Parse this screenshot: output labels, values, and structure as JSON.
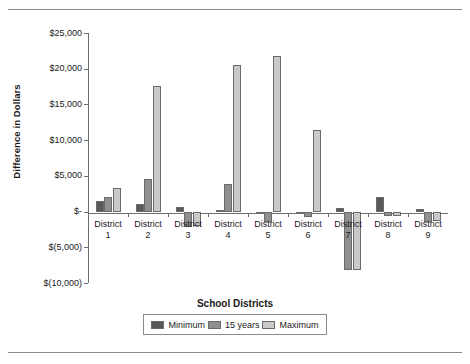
{
  "chart_data": {
    "type": "bar",
    "title": "",
    "xlabel": "School Districts",
    "ylabel": "Difference in Dollars",
    "categories": [
      "District 1",
      "District 2",
      "District 3",
      "District 4",
      "District 5",
      "District 6",
      "District 7",
      "District 8",
      "District 9"
    ],
    "category_lines": [
      [
        "District",
        "1"
      ],
      [
        "District",
        "2"
      ],
      [
        "District",
        "3"
      ],
      [
        "District",
        "4"
      ],
      [
        "District",
        "5"
      ],
      [
        "District",
        "6"
      ],
      [
        "District",
        "7"
      ],
      [
        "District",
        "8"
      ],
      [
        "District",
        "9"
      ]
    ],
    "series": [
      {
        "name": "Minimum",
        "color": "#595959",
        "values": [
          1500,
          1100,
          600,
          250,
          -200,
          -150,
          500,
          2000,
          400
        ]
      },
      {
        "name": "15 years",
        "color": "#8f8f8f",
        "values": [
          2100,
          4600,
          -2100,
          3850,
          -1500,
          -700,
          -8200,
          -600,
          -1400
        ]
      },
      {
        "name": "Maximum",
        "color": "#c9c9c9",
        "values": [
          3300,
          17600,
          -2050,
          20500,
          21800,
          11400,
          -8200,
          -600,
          -1350
        ]
      }
    ],
    "ylim": [
      -10000,
      25000
    ],
    "yticks": [
      25000,
      20000,
      15000,
      10000,
      5000,
      0,
      -5000,
      -10000
    ],
    "ytick_labels": [
      "$25,000",
      "$20,000",
      "$15,000",
      "$10,000",
      "$5,000",
      "$-",
      "$(5,000)",
      "$(10,000)"
    ],
    "grid": false,
    "legend_position": "bottom",
    "legend_entries": [
      "Minimum",
      "15 years",
      "Maximum"
    ]
  },
  "page": {
    "ghost_text": "",
    "top_rule": "",
    "bottom_rule": ""
  }
}
